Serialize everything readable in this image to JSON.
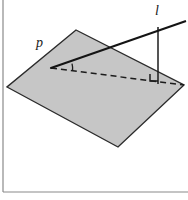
{
  "figure": {
    "kind": "geometry-diagram",
    "canvas": {
      "width": 188,
      "height": 200,
      "background": "#ffffff"
    },
    "frame": {
      "left_rule_x": 3,
      "bottom_rule_y": 192,
      "color": "#8a8a8a"
    }
  },
  "colors": {
    "plane_fill": "#c6c6c6",
    "plane_stroke": "#2b2b2b",
    "line_stroke": "#141414",
    "dashed_stroke": "#1c1c1c",
    "perp_stroke": "#1c1c1c",
    "label_color": "#1a1a1a",
    "frame_rule": "#8a8a8a"
  },
  "labels": [
    {
      "id": "plane-label",
      "name": "p",
      "text": "p",
      "x": 36,
      "y": 47,
      "font_size": 14,
      "style": "italic",
      "meaning": "name of the plane"
    },
    {
      "id": "line-label",
      "name": "l",
      "text": "l",
      "x": 155,
      "y": 15,
      "font_size": 14,
      "style": "italic",
      "meaning": "name of the oblique line"
    }
  ],
  "geometry": {
    "plane": {
      "name": "plane-p",
      "points": "76,30 184,85 118,147 7,87",
      "vertices": [
        {
          "label": "top",
          "x": 76,
          "y": 30
        },
        {
          "label": "right",
          "x": 184,
          "y": 85
        },
        {
          "label": "bottom",
          "x": 118,
          "y": 147
        },
        {
          "label": "left",
          "x": 7,
          "y": 87
        }
      ],
      "fill": "#c6c6c6",
      "stroke_width": 1.4
    },
    "oblique_line": {
      "name": "line-l",
      "x1": 51,
      "y1": 68,
      "x2": 186,
      "y2": 21,
      "stroke_width": 2.1
    },
    "projection_line": {
      "name": "projection-of-l",
      "x1": 51,
      "y1": 68,
      "x2": 184,
      "y2": 85,
      "stroke_width": 1.5,
      "dash": "6,4"
    },
    "perpendicular": {
      "name": "perpendicular-segment",
      "x1": 158,
      "y1": 27,
      "x2": 158,
      "y2": 84,
      "stroke_width": 1.5
    },
    "right_angle_mark": {
      "name": "right-angle-mark",
      "path": "M 150 74 L 150 81 L 158 81",
      "stroke_width": 1.5
    },
    "angle_arc": {
      "name": "angle-arc",
      "path": "M 72 63.7 A 21 21 0 0 1 72.6 70.6",
      "stroke_width": 1.3
    },
    "vertex_dot": {
      "name": "angle-vertex",
      "x": 51,
      "y": 68,
      "r": 1.1
    }
  }
}
